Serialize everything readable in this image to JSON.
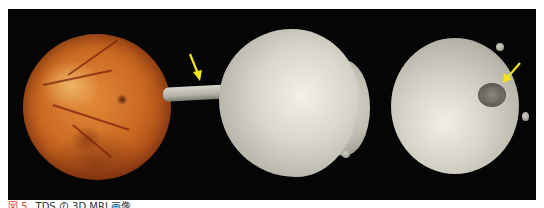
{
  "figure": {
    "caption": {
      "label": "図 5",
      "text": "TDS の 3D MRI 画像"
    },
    "panels": [
      {
        "name": "fundus-photograph",
        "description": "fundus photograph"
      },
      {
        "name": "3d-mri-globe-lateral",
        "description": "3D MRI globe with optic nerve, arrow"
      },
      {
        "name": "3d-mri-globe-posterior",
        "description": "3D MRI globe posterior view, arrow"
      }
    ],
    "colors": {
      "background": "#050505",
      "arrow": "#f2e51c",
      "caption_label": "#e0452f",
      "caption_text": "#333333"
    }
  }
}
